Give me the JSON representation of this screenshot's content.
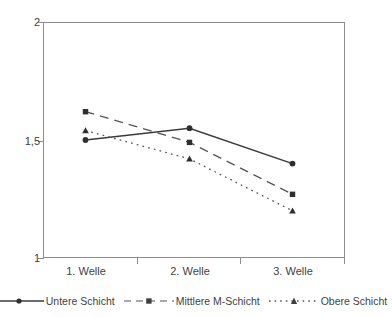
{
  "chart_data": {
    "type": "line",
    "title": "",
    "subtitle": "",
    "xlabel": "",
    "ylabel": "",
    "categories": [
      "1. Welle",
      "2. Welle",
      "3. Welle"
    ],
    "ylim": [
      1,
      2
    ],
    "yticks": [
      "1",
      "1,5",
      "2"
    ],
    "ytick_values": [
      1,
      1.5,
      2
    ],
    "grid": false,
    "legend_position": "bottom",
    "series": [
      {
        "name": "Untere Schicht",
        "values": [
          1.5,
          1.55,
          1.4
        ],
        "line_style": "solid",
        "marker": "circle",
        "color": "#3a3a3a"
      },
      {
        "name": "Mittlere M-Schicht",
        "values": [
          1.62,
          1.49,
          1.27
        ],
        "line_style": "dashed",
        "marker": "square",
        "color": "#545454"
      },
      {
        "name": "Obere Schicht",
        "values": [
          1.54,
          1.42,
          1.2
        ],
        "line_style": "dotted",
        "marker": "triangle",
        "color": "#545454"
      }
    ]
  },
  "axes": {
    "y": {
      "top_label": "2",
      "mid_label": "1,5",
      "bottom_label": "1"
    },
    "x": {
      "labels": [
        "1. Welle",
        "2. Welle",
        "3. Welle"
      ]
    }
  },
  "legend": {
    "entries": [
      {
        "label": "Untere Schicht"
      },
      {
        "label": "Mittlere M-Schicht"
      },
      {
        "label": "Obere Schicht"
      }
    ]
  },
  "colors": {
    "axis": "#8d8d8d",
    "series_untere": "#3a3a3a",
    "series_mittlere": "#545454",
    "series_obere": "#545454",
    "text": "#3f3f3f",
    "background": "#ffffff"
  }
}
